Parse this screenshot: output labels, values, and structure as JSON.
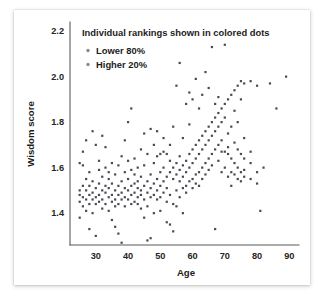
{
  "chart_data": {
    "type": "scatter",
    "title": "",
    "xlabel": "Age",
    "ylabel": "Wisdom score",
    "xlim": [
      22,
      93
    ],
    "ylim": [
      1.26,
      2.24
    ],
    "xticks": [
      30,
      40,
      50,
      60,
      70,
      80,
      90
    ],
    "yticks": [
      1.4,
      1.6,
      1.8,
      2.0,
      2.2
    ],
    "grid": false,
    "legend_position": "top-left",
    "annotations": [
      "Individual rankings shown in colored dots"
    ],
    "series": [
      {
        "name": "Lower 80%",
        "color": "#4a4a52",
        "points": [
          [
            25,
            1.62
          ],
          [
            25,
            1.45
          ],
          [
            25,
            1.5
          ],
          [
            25,
            1.48
          ],
          [
            25,
            1.38
          ],
          [
            26,
            1.52
          ],
          [
            26,
            1.47
          ],
          [
            26,
            1.43
          ],
          [
            26,
            1.67
          ],
          [
            26,
            1.61
          ],
          [
            27,
            1.5
          ],
          [
            27,
            1.46
          ],
          [
            27,
            1.55
          ],
          [
            27,
            1.41
          ],
          [
            27,
            1.72
          ],
          [
            28,
            1.48
          ],
          [
            28,
            1.52
          ],
          [
            28,
            1.44
          ],
          [
            28,
            1.58
          ],
          [
            28,
            1.33
          ],
          [
            29,
            1.49
          ],
          [
            29,
            1.46
          ],
          [
            29,
            1.54
          ],
          [
            29,
            1.4
          ],
          [
            29,
            1.76
          ],
          [
            30,
            1.51
          ],
          [
            30,
            1.47
          ],
          [
            30,
            1.44
          ],
          [
            30,
            1.3
          ],
          [
            30,
            1.7
          ],
          [
            31,
            1.53
          ],
          [
            31,
            1.48
          ],
          [
            31,
            1.45
          ],
          [
            31,
            1.59
          ],
          [
            31,
            1.63
          ],
          [
            32,
            1.5
          ],
          [
            32,
            1.46
          ],
          [
            32,
            1.42
          ],
          [
            32,
            1.56
          ],
          [
            32,
            1.74
          ],
          [
            33,
            1.49
          ],
          [
            33,
            1.52
          ],
          [
            33,
            1.44
          ],
          [
            33,
            1.69
          ],
          [
            33,
            1.6
          ],
          [
            34,
            1.47
          ],
          [
            34,
            1.51
          ],
          [
            34,
            1.55
          ],
          [
            34,
            1.41
          ],
          [
            34,
            1.58
          ],
          [
            35,
            1.48
          ],
          [
            35,
            1.53
          ],
          [
            35,
            1.45
          ],
          [
            35,
            1.62
          ],
          [
            35,
            1.37
          ],
          [
            36,
            1.5
          ],
          [
            36,
            1.46
          ],
          [
            36,
            1.57
          ],
          [
            36,
            1.43
          ],
          [
            36,
            1.34
          ],
          [
            37,
            1.52
          ],
          [
            37,
            1.48
          ],
          [
            37,
            1.61
          ],
          [
            37,
            1.44
          ],
          [
            37,
            1.31
          ],
          [
            38,
            1.49
          ],
          [
            38,
            1.54
          ],
          [
            38,
            1.46
          ],
          [
            38,
            1.27
          ],
          [
            38,
            1.65
          ],
          [
            39,
            1.51
          ],
          [
            39,
            1.47
          ],
          [
            39,
            1.58
          ],
          [
            39,
            1.43
          ],
          [
            39,
            1.72
          ],
          [
            40,
            1.5
          ],
          [
            40,
            1.55
          ],
          [
            40,
            1.46
          ],
          [
            40,
            1.8
          ],
          [
            40,
            1.63
          ],
          [
            41,
            1.52
          ],
          [
            41,
            1.48
          ],
          [
            41,
            1.44
          ],
          [
            41,
            1.59
          ],
          [
            41,
            1.86
          ],
          [
            42,
            1.53
          ],
          [
            42,
            1.49
          ],
          [
            42,
            1.64
          ],
          [
            42,
            1.45
          ],
          [
            42,
            1.57
          ],
          [
            43,
            1.51
          ],
          [
            43,
            1.47
          ],
          [
            43,
            1.6
          ],
          [
            43,
            1.54
          ],
          [
            43,
            1.44
          ],
          [
            44,
            1.5
          ],
          [
            44,
            1.56
          ],
          [
            44,
            1.48
          ],
          [
            44,
            1.68
          ],
          [
            44,
            1.42
          ],
          [
            45,
            1.52
          ],
          [
            45,
            1.46
          ],
          [
            45,
            1.61
          ],
          [
            45,
            1.75
          ],
          [
            45,
            1.38
          ],
          [
            46,
            1.49
          ],
          [
            46,
            1.54
          ],
          [
            46,
            1.66
          ],
          [
            46,
            1.43
          ],
          [
            46,
            1.28
          ],
          [
            47,
            1.51
          ],
          [
            47,
            1.57
          ],
          [
            47,
            1.47
          ],
          [
            47,
            1.77
          ],
          [
            47,
            1.29
          ],
          [
            48,
            1.53
          ],
          [
            48,
            1.48
          ],
          [
            48,
            1.62
          ],
          [
            48,
            1.7
          ],
          [
            48,
            1.4
          ],
          [
            49,
            1.5
          ],
          [
            49,
            1.55
          ],
          [
            49,
            1.65
          ],
          [
            49,
            1.46
          ],
          [
            49,
            1.76
          ],
          [
            50,
            1.52
          ],
          [
            50,
            1.58
          ],
          [
            50,
            1.66
          ],
          [
            50,
            1.47
          ],
          [
            50,
            1.41
          ],
          [
            51,
            1.54
          ],
          [
            51,
            1.6
          ],
          [
            51,
            1.67
          ],
          [
            51,
            1.49
          ],
          [
            51,
            1.73
          ],
          [
            52,
            1.56
          ],
          [
            52,
            1.51
          ],
          [
            52,
            1.66
          ],
          [
            52,
            1.45
          ],
          [
            52,
            1.36
          ],
          [
            53,
            1.58
          ],
          [
            53,
            1.63
          ],
          [
            53,
            1.7
          ],
          [
            53,
            1.48
          ],
          [
            53,
            1.35
          ],
          [
            54,
            1.6
          ],
          [
            54,
            1.55
          ],
          [
            54,
            1.78
          ],
          [
            54,
            1.44
          ],
          [
            54,
            1.32
          ],
          [
            55,
            1.62
          ],
          [
            55,
            1.57
          ],
          [
            55,
            1.96
          ],
          [
            55,
            1.5
          ],
          [
            55,
            1.43
          ],
          [
            56,
            1.59
          ],
          [
            56,
            1.65
          ],
          [
            56,
            1.54
          ],
          [
            56,
            2.06
          ],
          [
            56,
            1.47
          ],
          [
            57,
            1.61
          ],
          [
            57,
            1.56
          ],
          [
            57,
            1.73
          ],
          [
            57,
            1.51
          ],
          [
            57,
            1.4
          ],
          [
            58,
            1.63
          ],
          [
            58,
            1.58
          ],
          [
            58,
            1.88
          ],
          [
            58,
            1.52
          ],
          [
            58,
            1.49
          ],
          [
            59,
            1.66
          ],
          [
            59,
            1.6
          ],
          [
            59,
            1.79
          ],
          [
            59,
            1.54
          ],
          [
            59,
            1.93
          ],
          [
            60,
            1.68
          ],
          [
            60,
            1.62
          ],
          [
            60,
            1.9
          ],
          [
            60,
            1.55
          ],
          [
            60,
            1.51
          ],
          [
            61,
            1.7
          ],
          [
            61,
            1.64
          ],
          [
            61,
            1.99
          ],
          [
            61,
            1.57
          ],
          [
            61,
            1.53
          ],
          [
            62,
            1.72
          ],
          [
            62,
            1.66
          ],
          [
            62,
            1.86
          ],
          [
            62,
            1.58
          ],
          [
            62,
            1.52
          ],
          [
            63,
            1.74
          ],
          [
            63,
            1.68
          ],
          [
            63,
            1.92
          ],
          [
            63,
            1.6
          ],
          [
            63,
            1.55
          ],
          [
            64,
            1.76
          ],
          [
            64,
            1.7
          ],
          [
            64,
            2.02
          ],
          [
            64,
            1.62
          ],
          [
            64,
            1.57
          ],
          [
            65,
            1.78
          ],
          [
            65,
            1.72
          ],
          [
            65,
            1.95
          ],
          [
            65,
            1.64
          ],
          [
            65,
            1.59
          ],
          [
            66,
            1.8
          ],
          [
            66,
            1.74
          ],
          [
            66,
            2.13
          ],
          [
            66,
            1.66
          ],
          [
            66,
            1.61
          ],
          [
            67,
            1.82
          ],
          [
            67,
            1.76
          ],
          [
            67,
            1.88
          ],
          [
            67,
            1.68
          ],
          [
            67,
            1.33
          ],
          [
            68,
            1.84
          ],
          [
            68,
            1.78
          ],
          [
            68,
            1.91
          ],
          [
            68,
            1.7
          ],
          [
            68,
            1.63
          ],
          [
            69,
            1.86
          ],
          [
            69,
            1.8
          ],
          [
            69,
            1.67
          ],
          [
            69,
            1.58
          ],
          [
            69,
            1.72
          ],
          [
            70,
            1.88
          ],
          [
            70,
            1.82
          ],
          [
            70,
            1.67
          ],
          [
            70,
            1.6
          ],
          [
            70,
            2.14
          ],
          [
            71,
            1.9
          ],
          [
            71,
            1.75
          ],
          [
            71,
            1.66
          ],
          [
            71,
            1.56
          ],
          [
            71,
            1.69
          ],
          [
            72,
            1.92
          ],
          [
            72,
            1.78
          ],
          [
            72,
            1.64
          ],
          [
            72,
            1.58
          ],
          [
            72,
            1.52
          ],
          [
            73,
            1.94
          ],
          [
            73,
            1.71
          ],
          [
            73,
            1.62
          ],
          [
            73,
            1.57
          ],
          [
            73,
            1.85
          ],
          [
            74,
            1.96
          ],
          [
            74,
            1.68
          ],
          [
            74,
            1.6
          ],
          [
            74,
            1.55
          ],
          [
            74,
            1.8
          ],
          [
            75,
            1.98
          ],
          [
            75,
            1.66
          ],
          [
            75,
            1.58
          ],
          [
            75,
            1.54
          ],
          [
            75,
            1.9
          ],
          [
            76,
            1.97
          ],
          [
            76,
            1.64
          ],
          [
            76,
            1.56
          ],
          [
            76,
            1.59
          ],
          [
            76,
            1.73
          ],
          [
            78,
            1.67
          ],
          [
            78,
            1.55
          ],
          [
            78,
            1.98
          ],
          [
            78,
            1.62
          ],
          [
            80,
            1.58
          ],
          [
            80,
            1.96
          ],
          [
            80,
            1.53
          ],
          [
            81,
            1.41
          ],
          [
            82,
            1.6
          ],
          [
            84,
            1.97
          ],
          [
            86,
            1.86
          ],
          [
            89,
            2.0
          ]
        ]
      },
      {
        "name": "Higher 20%",
        "color": "#4a4a52",
        "points": []
      }
    ]
  },
  "legend": {
    "title": "Individual rankings shown in colored dots",
    "entries": [
      {
        "label": "Lower 80%",
        "marker": "dot-marker"
      },
      {
        "label": "Higher 20%",
        "marker": "dot-marker"
      }
    ]
  },
  "axes": {
    "x_title": "Age",
    "y_title": "Wisdom score",
    "x_tick_labels": [
      "30",
      "40",
      "50",
      "60",
      "70",
      "80",
      "90"
    ],
    "y_tick_labels": [
      "1.4",
      "1.6",
      "1.8",
      "2.0",
      "2.2"
    ]
  },
  "colors": {
    "dot": "#4a4a52",
    "legend_dot": "#8a8a92",
    "axis": "#5b5b5b",
    "text": "#1c1c1c",
    "card_background": "#ffffff",
    "page_background": "#ffffff"
  }
}
